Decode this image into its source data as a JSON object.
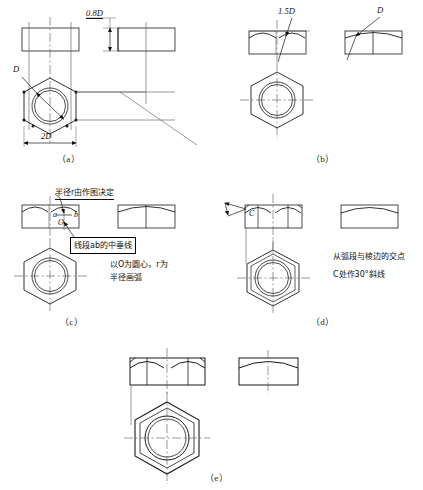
{
  "figure": {
    "title_visible": false,
    "background_color": "#ffffff",
    "line_color": "#1a1a1a",
    "centerline_color": "#555555",
    "panels": [
      {
        "id": "a",
        "label": "（a）",
        "caption_x": 57,
        "caption_y": 152
      },
      {
        "id": "b",
        "label": "（b）",
        "caption_x": 311,
        "caption_y": 152
      },
      {
        "id": "c",
        "label": "（c）",
        "caption_x": 60,
        "caption_y": 315
      },
      {
        "id": "d",
        "label": "（d）",
        "caption_x": 311,
        "caption_y": 315
      },
      {
        "id": "e",
        "label": "（e）",
        "caption_x": 205,
        "caption_y": 471
      }
    ]
  },
  "dimensions": {
    "panel_a_height": "0.8D",
    "panel_a_width": "2D",
    "panel_a_diameter": "D",
    "panel_b_left_radius": "1.5D",
    "panel_b_right_radius": "D"
  },
  "annotations": {
    "panel_c_radius_note": "半径r由作图决定",
    "panel_c_bisector_note": "线段ab的中垂线",
    "panel_c_arc_note_line1": "以O为圆心，r为",
    "panel_c_arc_note_line2": "半径画弧",
    "panel_d_note_line1": "从弧段与棱边的交点",
    "panel_d_note_line2": "C处作30°斜线"
  },
  "point_labels": {
    "panel_c_a": "a",
    "panel_c_b": "b",
    "panel_c_o": "O",
    "panel_d_c": "C"
  }
}
